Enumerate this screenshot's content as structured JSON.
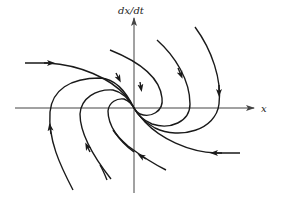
{
  "diagram": {
    "type": "phase-portrait",
    "axes": {
      "y_label": "dx/dt",
      "x_label": "x",
      "color": "#444444"
    },
    "trajectory_color": "#1a1a1a",
    "background": "#ffffff"
  }
}
